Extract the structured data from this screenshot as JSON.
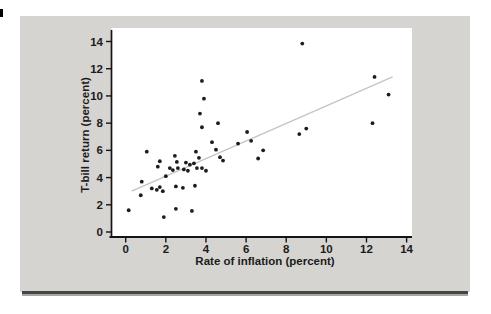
{
  "page": {
    "bg": "#ffffff",
    "panel_bg": "#d6d4d0",
    "plot_bg": "#ffffff",
    "edge_mark_color": "#000000",
    "bottom_rule_dark": "#454545",
    "bottom_rule_light": "#a8a6a3"
  },
  "chart_data": {
    "type": "scatter",
    "title": "",
    "xlabel": "Rate of inflation (percent)",
    "ylabel": "T-bill return (percent)",
    "xlim": [
      0,
      14
    ],
    "ylim": [
      0,
      14
    ],
    "x_ticks": [
      0,
      2,
      4,
      6,
      8,
      10,
      12,
      14
    ],
    "y_ticks": [
      0,
      2,
      4,
      6,
      8,
      10,
      12,
      14
    ],
    "grid": false,
    "legend": "none",
    "axis_color": "#141414",
    "tick_label_color": "#1b1b1b",
    "dot_color": "#1c1c1c",
    "points": [
      [
        0.15,
        1.6
      ],
      [
        1.9,
        1.1
      ],
      [
        2.5,
        1.7
      ],
      [
        3.3,
        1.55
      ],
      [
        0.75,
        2.7
      ],
      [
        0.8,
        3.7
      ],
      [
        1.3,
        3.2
      ],
      [
        1.55,
        3.1
      ],
      [
        1.7,
        3.3
      ],
      [
        1.85,
        3.0
      ],
      [
        2.5,
        3.35
      ],
      [
        2.85,
        3.25
      ],
      [
        3.45,
        3.4
      ],
      [
        2.0,
        4.1
      ],
      [
        1.6,
        4.8
      ],
      [
        2.2,
        4.7
      ],
      [
        2.35,
        4.55
      ],
      [
        2.6,
        4.7
      ],
      [
        2.9,
        4.6
      ],
      [
        3.1,
        4.5
      ],
      [
        3.55,
        4.7
      ],
      [
        3.4,
        5.05
      ],
      [
        1.7,
        5.2
      ],
      [
        1.05,
        5.9
      ],
      [
        2.45,
        5.6
      ],
      [
        2.55,
        5.15
      ],
      [
        3.0,
        5.1
      ],
      [
        3.2,
        4.95
      ],
      [
        3.5,
        5.9
      ],
      [
        3.65,
        5.45
      ],
      [
        3.8,
        4.7
      ],
      [
        4.0,
        4.5
      ],
      [
        4.3,
        6.6
      ],
      [
        4.5,
        6.05
      ],
      [
        4.7,
        5.5
      ],
      [
        4.85,
        5.25
      ],
      [
        5.6,
        6.5
      ],
      [
        6.05,
        7.35
      ],
      [
        6.25,
        6.7
      ],
      [
        6.85,
        6.0
      ],
      [
        6.6,
        5.4
      ],
      [
        8.65,
        7.2
      ],
      [
        9.0,
        7.6
      ],
      [
        3.7,
        8.7
      ],
      [
        3.8,
        7.7
      ],
      [
        4.6,
        8.0
      ],
      [
        3.8,
        11.1
      ],
      [
        3.9,
        9.8
      ],
      [
        8.8,
        13.85
      ],
      [
        12.4,
        11.4
      ],
      [
        13.1,
        10.1
      ],
      [
        12.3,
        8.0
      ]
    ],
    "trend_line": {
      "x1": 0.3,
      "y1": 3.0,
      "x2": 13.3,
      "y2": 11.4,
      "color": "#c8c5bf"
    }
  }
}
